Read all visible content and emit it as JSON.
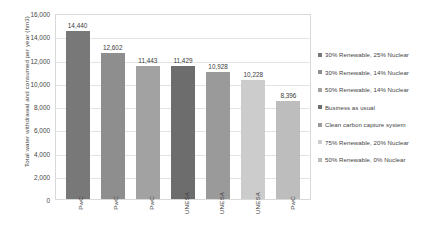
{
  "chart_data": {
    "type": "bar",
    "title": "",
    "xlabel": "",
    "ylabel": "Total water withdrawal and consumed per year (hm3)",
    "ylim": [
      0,
      16000
    ],
    "ytick_step": 2000,
    "ytick_labels": [
      "16,000",
      "14,000",
      "12,000",
      "10,000",
      "8,000",
      "6,000",
      "4,000",
      "2,000",
      "0"
    ],
    "ytick_values": [
      16000,
      14000,
      12000,
      10000,
      8000,
      6000,
      4000,
      2000,
      0
    ],
    "grid": true,
    "legend_position": "right",
    "categories": [
      "PwC",
      "PwC",
      "PwC",
      "UNESA",
      "UNESA",
      "UNESA",
      "PwC"
    ],
    "values": [
      14440,
      12602,
      11443,
      11429,
      10928,
      10228,
      8396
    ],
    "value_labels": [
      "14,440",
      "12,602",
      "11,443",
      "11,429",
      "10,928",
      "10,228",
      "8,396"
    ],
    "bar_colors": [
      "#787878",
      "#8e8e8e",
      "#a2a2a2",
      "#6d6d6d",
      "#9a9a9a",
      "#cccccc",
      "#bdbdbd"
    ],
    "legend": [
      {
        "label": "30% Renewable, 25% Nuclear",
        "color": "#787878"
      },
      {
        "label": "30% Renewable, 14% Nuclear",
        "color": "#8e8e8e"
      },
      {
        "label": "50% Renewable, 14% Nuclear",
        "color": "#a2a2a2"
      },
      {
        "label": "Business as usual",
        "color": "#6d6d6d"
      },
      {
        "label": "Clean carbon capture system",
        "color": "#9a9a9a"
      },
      {
        "label": "75% Renewable, 20% Nuclear",
        "color": "#cccccc"
      },
      {
        "label": "50% Renewable, 0% Nuclear",
        "color": "#bdbdbd"
      }
    ]
  }
}
